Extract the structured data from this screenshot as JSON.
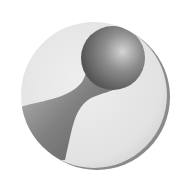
{
  "image": {
    "subject": "grayscale 3D rendered disc logo with sphere and neck shape",
    "colors": {
      "background": "#ffffff",
      "disc_light": "#e6e6e6",
      "disc_edge": "#9a9a9a",
      "shape_dark": "#5e5e5e",
      "shape_mid": "#9c9c9c",
      "highlight": "#d9d9d9"
    }
  }
}
